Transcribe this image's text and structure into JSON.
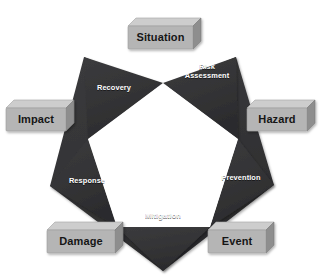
{
  "diagram": {
    "background_color": "#ffffff",
    "star_fill": "#333335",
    "star_center_fill": "#ffffff",
    "box_face_color": "#b4b4b4",
    "box_top_color": "#cfcfcf",
    "box_side_color": "#8f8f8f",
    "box_text_color": "#151515",
    "star_text_color": "#ffffff"
  },
  "star_labels": [
    {
      "id": "recovery",
      "text": "Recovery"
    },
    {
      "id": "risk-assessment",
      "text": "Risk\nAssessment"
    },
    {
      "id": "prevention",
      "text": "Prevention"
    },
    {
      "id": "mitigation",
      "text": "Mitigation"
    },
    {
      "id": "response",
      "text": "Response"
    }
  ],
  "boxes": [
    {
      "id": "situation",
      "text": "Situation"
    },
    {
      "id": "hazard",
      "text": "Hazard"
    },
    {
      "id": "event",
      "text": "Event"
    },
    {
      "id": "damage",
      "text": "Damage"
    },
    {
      "id": "impact",
      "text": "Impact"
    }
  ]
}
